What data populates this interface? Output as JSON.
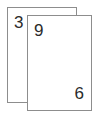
{
  "canvas": {
    "width": 99,
    "height": 119,
    "background_color": "#ffffff"
  },
  "style": {
    "card_fill": "#ffffff",
    "card_border_color": "#8d8d8d",
    "text_color": "#2b2b2b"
  },
  "cards": [
    {
      "id": "back-card",
      "position": "behind",
      "corner_top_left": "3",
      "corner_bottom_right": ""
    },
    {
      "id": "front-card",
      "position": "front",
      "corner_top_left": "9",
      "corner_bottom_right": "6"
    }
  ]
}
